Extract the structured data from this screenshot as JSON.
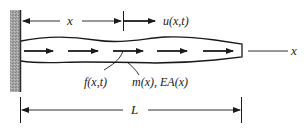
{
  "diagram": {
    "labels": {
      "x_dimension": "x",
      "displacement": "u(x,t)",
      "axis": "x",
      "distributed_force": "f(x,t)",
      "properties": "m(x), EA(x)",
      "length": "L"
    },
    "colors": {
      "ink": "#1a1a1a",
      "wall_fill": "#9a9a9a",
      "wall_edge": "#2a2a2a",
      "background": "#ffffff"
    },
    "elements": {
      "wall": "fixed-support-hatched",
      "bar": "tapered-bar",
      "force_arrows_count": 5
    }
  }
}
